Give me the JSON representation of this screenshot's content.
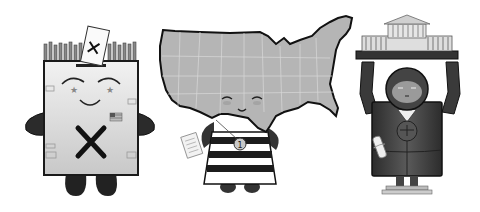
{
  "illustration": {
    "characters": [
      {
        "id": "ballot-box",
        "description": "Ballot box mascot with smiling face, ballot with X being inserted at top, crowd of raised hands behind, large X on belly, small US flag",
        "ballot_mark": "X",
        "belly_mark": "X"
      },
      {
        "id": "usa-map",
        "description": "United States map mascot with smiling face, wearing black-and-white striped shirt, holding a document, medal with number",
        "medal_number": "1"
      },
      {
        "id": "supreme-court",
        "description": "Judge mascot in dark robe holding a columned courthouse above head, scales-of-justice medallion, rolled scroll with ribbon"
      }
    ],
    "palette": {
      "background": "#ffffff",
      "outline": "#1a1a1a",
      "light_gray": "#d8d8d8",
      "mid_gray": "#a8a8a8",
      "dark_gray": "#4a4a4a"
    }
  }
}
